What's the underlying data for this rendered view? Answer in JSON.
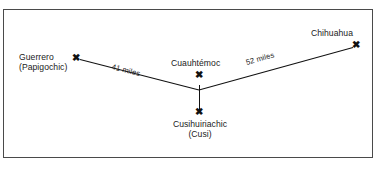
{
  "figure": {
    "type": "map-diagram",
    "background_color": "#ffffff",
    "frame": {
      "name": "diagram-border",
      "color": "#4a4a4a"
    },
    "line_color": "#111111",
    "text_color": "#1a1a1a"
  },
  "nodes": [
    {
      "id": "guerrero",
      "name_line1": "Guerrero",
      "name_line2": "(Papigochic)",
      "marker": "✖"
    },
    {
      "id": "cuauhtemoc",
      "name_line1": "Cuauhtémoc",
      "marker": "✖"
    },
    {
      "id": "cusihuiriachic",
      "name_line1": "Cusihuiriachic",
      "name_line2": "(Cusi)",
      "marker": "✖"
    },
    {
      "id": "chihuahua",
      "name_line1": "Chihuahua",
      "marker": "✖"
    }
  ],
  "edges": [
    {
      "id": "guerrero-cuauhtemoc",
      "from": "guerrero",
      "to": "cuauhtemoc",
      "distance_label": "41 miles",
      "distance_value": 41,
      "distance_unit": "miles"
    },
    {
      "id": "cuauhtemoc-chihuahua",
      "from": "cuauhtemoc",
      "to": "chihuahua",
      "distance_label": "52 miles",
      "distance_value": 52,
      "distance_unit": "miles"
    },
    {
      "id": "cuauhtemoc-cusihuiriachic",
      "from": "cuauhtemoc",
      "to": "cusihuiriachic",
      "distance_label": ""
    }
  ]
}
